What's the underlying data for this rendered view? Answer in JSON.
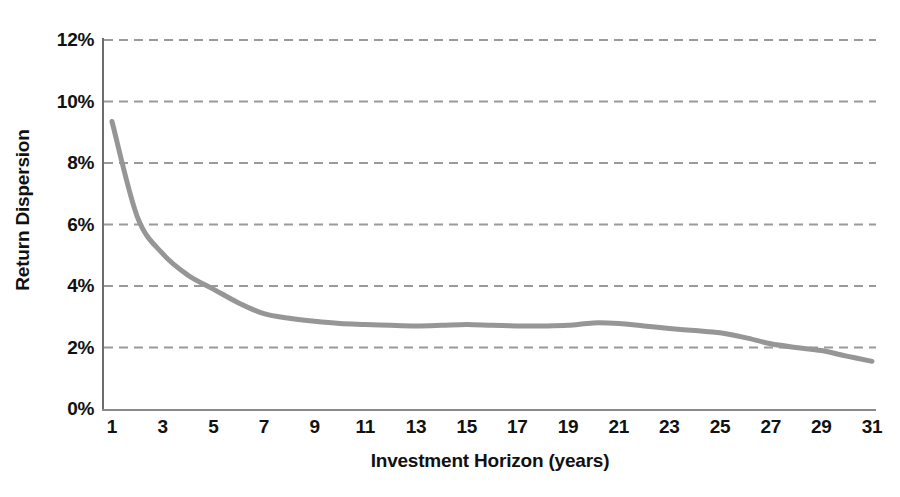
{
  "chart_data": {
    "type": "line",
    "title": "",
    "xlabel": "Investment Horizon (years)",
    "ylabel": "Return Dispersion",
    "xlim": [
      1,
      31
    ],
    "ylim": [
      0,
      12
    ],
    "grid": true,
    "legend_position": "none",
    "line_color": "#969696",
    "grid_color": "#9a9a9a",
    "axis_color": "#7a7a7a",
    "x_tick_labels": [
      "1",
      "3",
      "5",
      "7",
      "9",
      "11",
      "13",
      "15",
      "17",
      "19",
      "21",
      "23",
      "25",
      "27",
      "29",
      "31"
    ],
    "y_tick_labels": [
      "0%",
      "2%",
      "4%",
      "6%",
      "8%",
      "10%",
      "12%"
    ],
    "y_tick_values": [
      0,
      2,
      4,
      6,
      8,
      10,
      12
    ],
    "x": [
      1,
      2,
      3,
      4,
      5,
      6,
      7,
      8,
      9,
      10,
      11,
      12,
      13,
      14,
      15,
      16,
      17,
      18,
      19,
      20,
      21,
      22,
      23,
      24,
      25,
      26,
      27,
      28,
      29,
      30,
      31
    ],
    "values": [
      9.35,
      6.25,
      5.05,
      4.35,
      3.9,
      3.45,
      3.1,
      2.95,
      2.85,
      2.78,
      2.75,
      2.72,
      2.7,
      2.72,
      2.75,
      2.72,
      2.7,
      2.7,
      2.72,
      2.8,
      2.78,
      2.7,
      2.62,
      2.55,
      2.48,
      2.32,
      2.12,
      2.0,
      1.9,
      1.72,
      1.55
    ],
    "series": [
      {
        "name": "Return Dispersion",
        "values": [
          9.35,
          6.25,
          5.05,
          4.35,
          3.9,
          3.45,
          3.1,
          2.95,
          2.85,
          2.78,
          2.75,
          2.72,
          2.7,
          2.72,
          2.75,
          2.72,
          2.7,
          2.7,
          2.72,
          2.8,
          2.78,
          2.7,
          2.62,
          2.55,
          2.48,
          2.32,
          2.12,
          2.0,
          1.9,
          1.72,
          1.55
        ]
      }
    ]
  }
}
